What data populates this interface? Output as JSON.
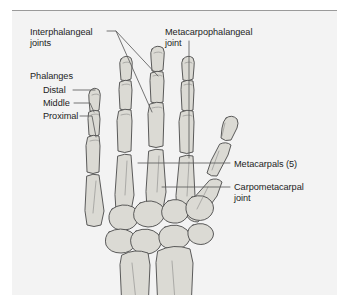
{
  "figure": {
    "panel_background": "#f3f3f3",
    "border_color": "#9a9a9a",
    "bone_fill": "#d9d8d2",
    "bone_fill_light": "#e6e5e0",
    "bone_outline": "#4a4a4a",
    "text_color": "#1d1d1d",
    "leader_color": "#5c5c5c"
  },
  "labels": {
    "interphalangeal": {
      "line1": "Interphalangeal",
      "line2": "joints",
      "full": "Interphalangeal joints"
    },
    "phalanges": "Phalanges",
    "distal": "Distal",
    "middle": "Middle",
    "proximal": "Proximal",
    "metacarpophalangeal": {
      "line1": "Metacarpophalangeal",
      "line2": "joint",
      "full": "Metacarpophalangeal joint"
    },
    "metacarpals": "Metacarpals (5)",
    "carpometacarpal": {
      "line1": "Carpometacarpal",
      "line2": "joint",
      "full": "Carpometacarpal joint"
    }
  }
}
